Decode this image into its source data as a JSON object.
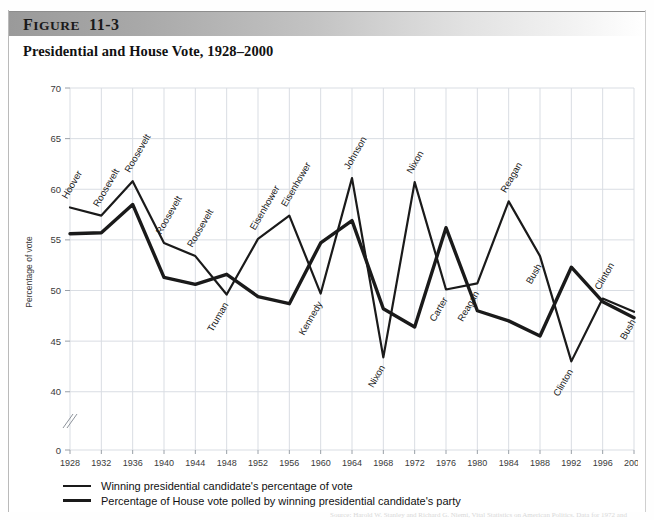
{
  "figure": {
    "label_word": "FIGURE",
    "label_word_cap": "F",
    "label_word_rest": "IGURE",
    "number": "11-3",
    "title": "Presidential and House Vote, 1928–2000"
  },
  "legend": {
    "items": [
      {
        "label": "Winning presidential candidate's percentage of vote",
        "color": "#1a1a1a",
        "weight": "thin"
      },
      {
        "label": "Percentage of House vote polled by winning presidential candidate's party",
        "color": "#1a1a1a",
        "weight": "thick"
      }
    ]
  },
  "axis": {
    "ylabel": "Percentage of vote",
    "yticks": [
      "0",
      "40",
      "45",
      "50",
      "55",
      "60",
      "65",
      "70"
    ],
    "break_marker": "//"
  },
  "source_note": "Source: Harold W. Stanley and Richard G. Niemi, Vital Statistics on American Politics. Data for 1972 and",
  "chart_data": {
    "type": "line",
    "xlabel": "",
    "ylabel": "Percentage of vote",
    "ylim": [
      38,
      71
    ],
    "yticks": [
      40,
      45,
      50,
      55,
      60,
      65,
      70
    ],
    "y_axis_break": true,
    "y_break_value": 0,
    "grid": true,
    "legend_position": "below",
    "categories": [
      1928,
      1932,
      1936,
      1940,
      1944,
      1948,
      1952,
      1956,
      1960,
      1964,
      1968,
      1972,
      1976,
      1980,
      1984,
      1988,
      1992,
      1996,
      2000
    ],
    "series": [
      {
        "name": "Winning presidential candidate's percentage of vote",
        "color": "#1a1a1a",
        "line_width": 2.2,
        "values": [
          58.2,
          57.4,
          60.8,
          54.7,
          53.4,
          49.6,
          55.1,
          57.4,
          49.7,
          61.1,
          43.4,
          60.7,
          50.1,
          50.7,
          58.8,
          53.4,
          43.0,
          49.2,
          47.9
        ]
      },
      {
        "name": "Percentage of House vote polled by winning presidential candidate's party",
        "color": "#1a1a1a",
        "line_width": 3.4,
        "values": [
          55.6,
          55.7,
          58.5,
          51.3,
          50.6,
          51.6,
          49.4,
          48.7,
          54.7,
          56.9,
          48.2,
          46.4,
          56.2,
          48.0,
          47.0,
          45.5,
          52.3,
          48.9,
          47.3
        ]
      }
    ],
    "annotations": [
      {
        "text": "Hoover",
        "year": 1928,
        "value": 58.2,
        "series": 0,
        "placement": "above"
      },
      {
        "text": "Roosevelt",
        "year": 1932,
        "value": 57.4,
        "series": 0,
        "placement": "above"
      },
      {
        "text": "Roosevelt",
        "year": 1936,
        "value": 60.8,
        "series": 0,
        "placement": "above"
      },
      {
        "text": "Roosevelt",
        "year": 1940,
        "value": 54.7,
        "series": 0,
        "placement": "above"
      },
      {
        "text": "Roosevelt",
        "year": 1944,
        "value": 53.4,
        "series": 0,
        "placement": "above"
      },
      {
        "text": "Truman",
        "year": 1948,
        "value": 49.6,
        "series": 0,
        "placement": "below"
      },
      {
        "text": "Eisenhower",
        "year": 1952,
        "value": 55.1,
        "series": 0,
        "placement": "above"
      },
      {
        "text": "Eisenhower",
        "year": 1956,
        "value": 57.4,
        "series": 0,
        "placement": "above"
      },
      {
        "text": "Kennedy",
        "year": 1960,
        "value": 49.7,
        "series": 0,
        "placement": "below"
      },
      {
        "text": "Johnson",
        "year": 1964,
        "value": 61.1,
        "series": 0,
        "placement": "above"
      },
      {
        "text": "Nixon",
        "year": 1968,
        "value": 43.4,
        "series": 0,
        "placement": "below"
      },
      {
        "text": "Nixon",
        "year": 1972,
        "value": 60.7,
        "series": 0,
        "placement": "above"
      },
      {
        "text": "Carter",
        "year": 1976,
        "value": 50.1,
        "series": 0,
        "placement": "below"
      },
      {
        "text": "Reagan",
        "year": 1980,
        "value": 50.7,
        "series": 0,
        "placement": "below"
      },
      {
        "text": "Reagan",
        "year": 1984,
        "value": 58.8,
        "series": 0,
        "placement": "above"
      },
      {
        "text": "Bush",
        "year": 1988,
        "value": 53.4,
        "series": 0,
        "placement": "below"
      },
      {
        "text": "Clinton",
        "year": 1992,
        "value": 43.0,
        "series": 0,
        "placement": "below"
      },
      {
        "text": "Clinton",
        "year": 1996,
        "value": 49.2,
        "series": 0,
        "placement": "above"
      },
      {
        "text": "Bush",
        "year": 2000,
        "value": 47.9,
        "series": 0,
        "placement": "below"
      }
    ]
  }
}
